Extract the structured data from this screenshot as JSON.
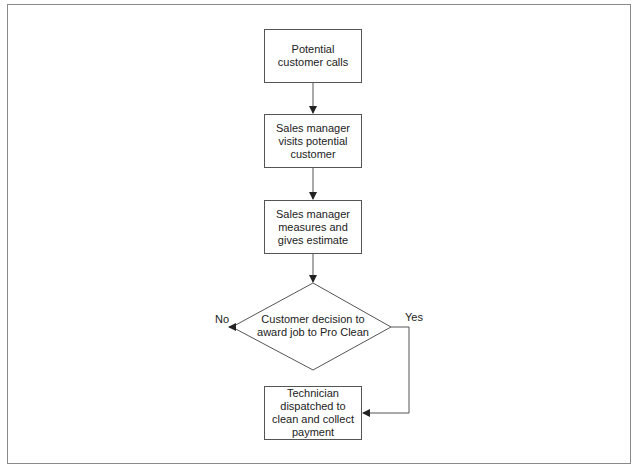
{
  "diagram": {
    "type": "flowchart",
    "nodes": [
      {
        "id": "n1",
        "shape": "rectangle",
        "label": "Potential customer calls"
      },
      {
        "id": "n2",
        "shape": "rectangle",
        "label": "Sales manager visits potential customer"
      },
      {
        "id": "n3",
        "shape": "rectangle",
        "label": "Sales manager measures and gives estimate"
      },
      {
        "id": "n4",
        "shape": "diamond",
        "label": "Customer decision to award job to Pro Clean"
      },
      {
        "id": "n5",
        "shape": "rectangle",
        "label": "Technician dispatched to clean and collect payment"
      }
    ],
    "edges": [
      {
        "from": "n1",
        "to": "n2",
        "label": ""
      },
      {
        "from": "n2",
        "to": "n3",
        "label": ""
      },
      {
        "from": "n3",
        "to": "n4",
        "label": ""
      },
      {
        "from": "n4",
        "to": "end-no",
        "label": "No"
      },
      {
        "from": "n4",
        "to": "n5",
        "label": "Yes"
      }
    ],
    "labels": {
      "no": "No",
      "yes": "Yes"
    },
    "colors": {
      "stroke": "#555555",
      "frame": "#8a8a8a",
      "text": "#222222",
      "background": "#ffffff"
    }
  }
}
